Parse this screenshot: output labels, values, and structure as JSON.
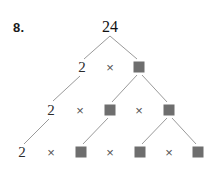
{
  "worksheet": {
    "problem_number": "8.",
    "background_color": "#ffffff",
    "line_color": "#9a9a9a",
    "square_color": "#6e6e6e",
    "text_color": "#2b2b2b"
  },
  "tree": {
    "root": {
      "label": "24",
      "x": 110,
      "y": 27
    },
    "rows": [
      {
        "row_index": 1,
        "items": [
          {
            "kind": "number",
            "label": "2",
            "x": 82,
            "y": 67
          },
          {
            "kind": "operator",
            "label": "×",
            "x": 110,
            "y": 67
          },
          {
            "kind": "square",
            "label": "",
            "x": 139,
            "y": 67
          }
        ]
      },
      {
        "row_index": 2,
        "items": [
          {
            "kind": "number",
            "label": "2",
            "x": 51,
            "y": 110
          },
          {
            "kind": "operator",
            "label": "×",
            "x": 80,
            "y": 110
          },
          {
            "kind": "square",
            "label": "",
            "x": 110,
            "y": 110
          },
          {
            "kind": "operator",
            "label": "×",
            "x": 139,
            "y": 110
          },
          {
            "kind": "square",
            "label": "",
            "x": 169,
            "y": 110
          }
        ]
      },
      {
        "row_index": 3,
        "items": [
          {
            "kind": "number",
            "label": "2",
            "x": 22,
            "y": 152
          },
          {
            "kind": "operator",
            "label": "×",
            "x": 51,
            "y": 152
          },
          {
            "kind": "square",
            "label": "",
            "x": 81,
            "y": 152
          },
          {
            "kind": "operator",
            "label": "×",
            "x": 110,
            "y": 152
          },
          {
            "kind": "square",
            "label": "",
            "x": 140,
            "y": 152
          },
          {
            "kind": "operator",
            "label": "×",
            "x": 169,
            "y": 152
          },
          {
            "kind": "square",
            "label": "",
            "x": 198,
            "y": 152
          }
        ]
      }
    ],
    "edges": [
      {
        "name": "root-to-left-2",
        "x1": 110,
        "y1": 36,
        "x2": 84,
        "y2": 59
      },
      {
        "name": "root-to-right-box",
        "x1": 110,
        "y1": 36,
        "x2": 137,
        "y2": 59
      },
      {
        "name": "left2-to-left2",
        "x1": 80,
        "y1": 76,
        "x2": 53,
        "y2": 101
      },
      {
        "name": "box1-to-left-box",
        "x1": 137,
        "y1": 75,
        "x2": 112,
        "y2": 102
      },
      {
        "name": "box1-to-right-box",
        "x1": 142,
        "y1": 75,
        "x2": 167,
        "y2": 102
      },
      {
        "name": "row2-left2-to-bottom2",
        "x1": 49,
        "y1": 119,
        "x2": 24,
        "y2": 144
      },
      {
        "name": "row2-box-to-bottom-box",
        "x1": 108,
        "y1": 118,
        "x2": 83,
        "y2": 144
      },
      {
        "name": "row2-rbox-to-bbox1",
        "x1": 167,
        "y1": 118,
        "x2": 142,
        "y2": 144
      },
      {
        "name": "row2-rbox-to-bbox2",
        "x1": 172,
        "y1": 118,
        "x2": 196,
        "y2": 144
      }
    ]
  }
}
